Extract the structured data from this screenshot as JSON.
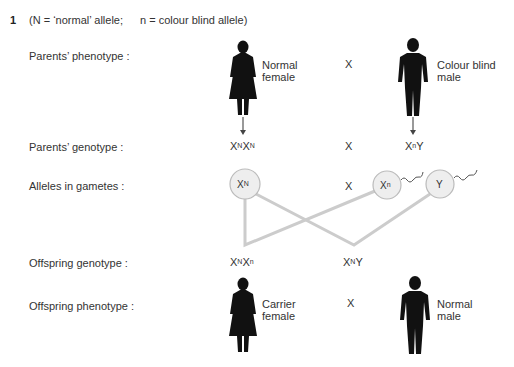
{
  "question": {
    "number": "1",
    "key_normal": "(N = ‘normal’ allele;",
    "key_cb": "n = colour blind allele)"
  },
  "rows": {
    "parents_phenotype": "Parents’ phenotype :",
    "parents_genotype": "Parents’ genotype :",
    "alleles_gametes": "Alleles in gametes :",
    "offspring_genotype": "Offspring genotype :",
    "offspring_phenotype": "Offspring phenotype :"
  },
  "cross_symbol": "X",
  "parents": {
    "female": {
      "label_line1": "Normal",
      "label_line2": "female",
      "genotype": [
        [
          "X",
          "N"
        ],
        [
          "X",
          "N"
        ]
      ]
    },
    "male": {
      "label_line1": "Colour blind",
      "label_line2": "male",
      "genotype": [
        [
          "X",
          "n"
        ],
        [
          "Y",
          ""
        ]
      ]
    }
  },
  "gametes": [
    {
      "base": "X",
      "sup": "N",
      "tail": false
    },
    {
      "base": "X",
      "sup": "n",
      "tail": true
    },
    {
      "base": "Y",
      "sup": "",
      "tail": true
    }
  ],
  "offspring": {
    "female": {
      "label_line1": "Carrier",
      "label_line2": "female",
      "genotype": [
        [
          "X",
          "N"
        ],
        [
          "X",
          "n"
        ]
      ]
    },
    "male": {
      "label_line1": "Normal",
      "label_line2": "male",
      "genotype": [
        [
          "X",
          "N"
        ],
        [
          "Y",
          ""
        ]
      ]
    }
  },
  "colors": {
    "text": "#333333",
    "figure": "#111111",
    "line": "#cccccc",
    "circle_fill": "#eeeeee",
    "circle_stroke": "#bbbbbb"
  }
}
